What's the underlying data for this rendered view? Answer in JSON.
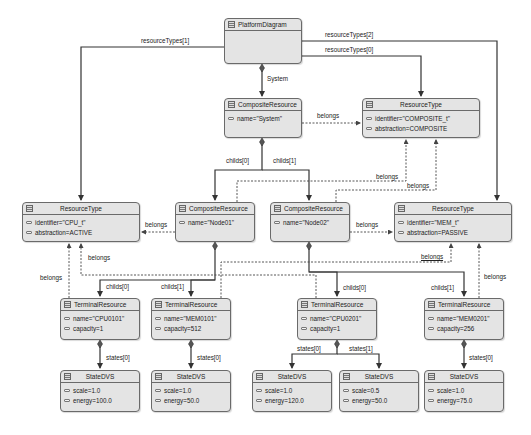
{
  "diagram": {
    "nodes": {
      "platform": {
        "type": "PlatformDiagram",
        "attrs": []
      },
      "system": {
        "type": "CompositeResource",
        "attrs": [
          "name=\"System\""
        ]
      },
      "rt_composite": {
        "type": "ResourceType",
        "attrs": [
          "identifier=\"COMPOSITE_t\"",
          "abstraction=COMPOSITE"
        ]
      },
      "rt_cpu": {
        "type": "ResourceType",
        "attrs": [
          "identifier=\"CPU_t\"",
          "abstraction=ACTIVE"
        ]
      },
      "node01": {
        "type": "CompositeResource",
        "attrs": [
          "name=\"Node01\""
        ]
      },
      "node02": {
        "type": "CompositeResource",
        "attrs": [
          "name=\"Node02\""
        ]
      },
      "rt_mem": {
        "type": "ResourceType",
        "attrs": [
          "identifier=\"MEM_t\"",
          "abstraction=PASSIVE"
        ]
      },
      "cpu0101": {
        "type": "TerminalResource",
        "attrs": [
          "name=\"CPU0101\"",
          "capacity=1"
        ]
      },
      "mem0101": {
        "type": "TerminalResource",
        "attrs": [
          "name=\"MEM0101\"",
          "capacity=512"
        ]
      },
      "cpu0201": {
        "type": "TerminalResource",
        "attrs": [
          "name=\"CPU0201\"",
          "capacity=1"
        ]
      },
      "mem0201": {
        "type": "TerminalResource",
        "attrs": [
          "name=\"MEM0201\"",
          "capacity=256"
        ]
      },
      "s_cpu0101_0": {
        "type": "StateDVS",
        "attrs": [
          "scale=1.0",
          "energy=100.0"
        ]
      },
      "s_mem0101_0": {
        "type": "StateDVS",
        "attrs": [
          "scale=1.0",
          "energy=50.0"
        ]
      },
      "s_cpu0201_0": {
        "type": "StateDVS",
        "attrs": [
          "scale=1.0",
          "energy=120.0"
        ]
      },
      "s_cpu0201_1": {
        "type": "StateDVS",
        "attrs": [
          "scale=0.5",
          "energy=50.0"
        ]
      },
      "s_mem0201_0": {
        "type": "StateDVS",
        "attrs": [
          "scale=1.0",
          "energy=75.0"
        ]
      }
    },
    "edges": {
      "resourceTypes_1": "resourceTypes[1]",
      "resourceTypes_2": "resourceTypes[2]",
      "resourceTypes_0": "resourceTypes[0]",
      "system": "System",
      "belongs": "belongs",
      "childs_0": "childs[0]",
      "childs_1": "childs[1]",
      "states_0": "states[0]",
      "states_1": "states[1]"
    }
  }
}
